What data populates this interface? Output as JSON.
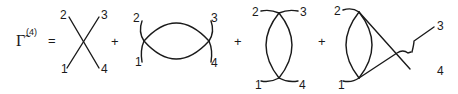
{
  "equation": {
    "lhs_symbol": "Γ̃",
    "lhs_superscript": "(4)",
    "equals": "=",
    "plus": "+"
  },
  "diagrams": [
    {
      "name": "tree-level-vertex",
      "labels": {
        "top_left": "2",
        "top_right": "3",
        "bottom_left": "1",
        "bottom_right": "4"
      }
    },
    {
      "name": "s-channel-bubble",
      "labels": {
        "top_left": "2",
        "top_right": "3",
        "bottom_left": "1",
        "bottom_right": "4"
      }
    },
    {
      "name": "t-channel-bubble",
      "labels": {
        "top_left": "2",
        "top_right": "3",
        "bottom_left": "1",
        "bottom_right": "4"
      }
    },
    {
      "name": "u-channel-bubble",
      "labels": {
        "top_left": "2",
        "top_right": "3",
        "bottom_left": "1",
        "bottom_right": "4"
      }
    }
  ]
}
